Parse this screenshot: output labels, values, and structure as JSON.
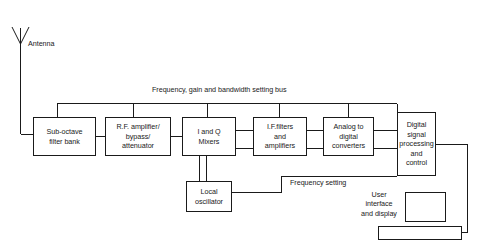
{
  "diagram": {
    "line_color": "#1a1a1a",
    "background": "#ffffff"
  },
  "labels": {
    "antenna": "Antenna",
    "control_bus": "Frequency, gain and bandwidth setting bus",
    "frequency_setting": "Frequency setting",
    "user_interface": "User\ninterface\nand display"
  },
  "blocks": [
    {
      "id": "sub-octave-filter-bank",
      "text": "Sub-octave\nfilter bank"
    },
    {
      "id": "rf-amplifier",
      "text": "R.F. amplifier/\nbypass/\nattenuator"
    },
    {
      "id": "i-and-q-mixers",
      "text": "I and Q\nMixers"
    },
    {
      "id": "if-filters-amplifiers",
      "text": "I.F.filters\nand\namplifiers"
    },
    {
      "id": "analog-to-digital",
      "text": "Analog to\ndigital\nconverters"
    },
    {
      "id": "digital-signal-processing",
      "text": "Digital\nsignal\nprocessing\nand\ncontrol"
    },
    {
      "id": "local-oscillator",
      "text": "Local\noscillator"
    }
  ],
  "devices": [
    {
      "id": "display-monitor"
    },
    {
      "id": "keyboard"
    }
  ]
}
